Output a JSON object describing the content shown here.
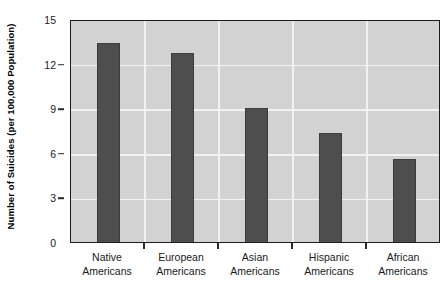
{
  "chart_data": {
    "type": "bar",
    "title": "",
    "subtitle": "",
    "xlabel": "",
    "ylabel": "Number of Suicides (per 100,000 Population)",
    "categories": [
      "Native Americans",
      "European Americans",
      "Asian Americans",
      "Hispanic Americans",
      "African Americans"
    ],
    "category_lines": [
      [
        "Native",
        "Americans"
      ],
      [
        "European",
        "Americans"
      ],
      [
        "Asian",
        "Americans"
      ],
      [
        "Hispanic",
        "Americans"
      ],
      [
        "African",
        "Americans"
      ]
    ],
    "values": [
      13.4,
      12.7,
      9.0,
      7.3,
      5.6
    ],
    "ylim": [
      0,
      15
    ],
    "yticks": [
      0,
      3,
      6,
      9,
      12,
      15
    ],
    "ytick_labels": [
      "0",
      "3",
      "6",
      "9",
      "12",
      "15"
    ],
    "grid": true,
    "grid_orientation": "both",
    "legend": null,
    "legend_position": "none",
    "annotations": [],
    "colors": {
      "bar": "#4e4e4e",
      "bar_edge": "#3a3a3a",
      "plot_background": "#d2d2d2",
      "gridline": "#f2f2f2",
      "plot_border": "#1c1c1c",
      "figure_background": "#ffffff",
      "text": "#1a1a1a"
    }
  }
}
